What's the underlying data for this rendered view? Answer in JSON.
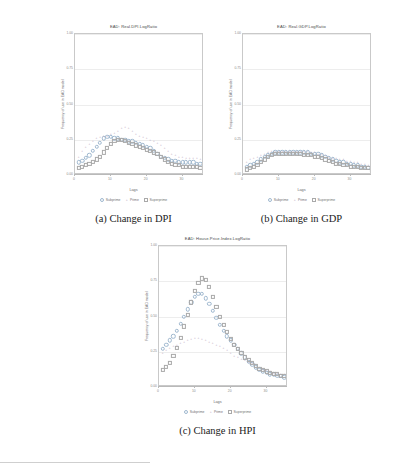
{
  "figure": {
    "panels": [
      {
        "id": "dpi",
        "title": "EAD: Real.DPI.LogRatio",
        "caption": "(a)  Change in DPI",
        "ylabel": "Frequency of use in EAD model",
        "xlabel": "Lags",
        "yticks": [
          "1.00",
          "0.75",
          "0.50",
          "0.25",
          "0.00"
        ],
        "xticks": [
          "0",
          "10",
          "20",
          "30"
        ],
        "legend": [
          {
            "key": "sub",
            "label": "Subprime"
          },
          {
            "key": "pri",
            "label": "Prime"
          },
          {
            "key": "sup",
            "label": "Superprime"
          }
        ]
      },
      {
        "id": "gdp",
        "title": "EAD: Real.GDP.LogRatio",
        "caption": "(b)  Change in GDP",
        "ylabel": "Frequency of use in EAD model",
        "xlabel": "Lags",
        "yticks": [
          "1.00",
          "0.75",
          "0.50",
          "0.25",
          "0.00"
        ],
        "xticks": [
          "0",
          "10",
          "20",
          "30"
        ],
        "legend": [
          {
            "key": "sub",
            "label": "Subprime"
          },
          {
            "key": "pri",
            "label": "Prime"
          },
          {
            "key": "sup",
            "label": "Superprime"
          }
        ]
      },
      {
        "id": "hpi",
        "title": "EAD: House.Price.Index.LogRatio",
        "caption": "(c)  Change in HPI",
        "ylabel": "Frequency of use in EAD model",
        "xlabel": "Lags",
        "yticks": [
          "1.00",
          "0.75",
          "0.50",
          "0.25",
          "0.00"
        ],
        "xticks": [
          "0",
          "10",
          "20",
          "30"
        ],
        "legend": [
          {
            "key": "sub",
            "label": "Subprime"
          },
          {
            "key": "pri",
            "label": "Prime"
          },
          {
            "key": "sup",
            "label": "Superprime"
          }
        ]
      }
    ]
  },
  "chart_data": [
    {
      "type": "scatter",
      "title": "EAD: Real.DPI.LogRatio",
      "xlabel": "Lags",
      "ylabel": "Frequency of use in EAD model",
      "xlim": [
        0,
        36
      ],
      "ylim": [
        0,
        1.0
      ],
      "yticks": [
        0.0,
        0.25,
        0.5,
        0.75,
        1.0
      ],
      "xticks": [
        0,
        10,
        20,
        30
      ],
      "grid": true,
      "legend_position": "bottom",
      "x": [
        1,
        2,
        3,
        4,
        5,
        6,
        7,
        8,
        9,
        10,
        11,
        12,
        13,
        14,
        15,
        16,
        17,
        18,
        19,
        20,
        21,
        22,
        23,
        24,
        25,
        26,
        27,
        28,
        29,
        30,
        31,
        32,
        33,
        34,
        35,
        36
      ],
      "series": [
        {
          "name": "Subprime",
          "marker": "open-circle",
          "color": "#9fb8cf",
          "values": [
            0.09,
            0.1,
            0.12,
            0.14,
            0.17,
            0.2,
            0.23,
            0.26,
            0.27,
            0.27,
            0.26,
            0.26,
            0.25,
            0.25,
            0.24,
            0.24,
            0.23,
            0.22,
            0.21,
            0.2,
            0.19,
            0.17,
            0.15,
            0.13,
            0.12,
            0.11,
            0.1,
            0.1,
            0.09,
            0.09,
            0.09,
            0.09,
            0.09,
            0.08,
            0.08,
            0.08
          ]
        },
        {
          "name": "Prime",
          "marker": "plus",
          "color": "#b9a7bd",
          "values": [
            0.13,
            0.17,
            0.2,
            0.22,
            0.24,
            0.26,
            0.27,
            0.28,
            0.28,
            0.29,
            0.3,
            0.31,
            0.33,
            0.34,
            0.33,
            0.31,
            0.29,
            0.28,
            0.27,
            0.26,
            0.25,
            0.24,
            0.23,
            0.21,
            0.19,
            0.17,
            0.15,
            0.14,
            0.13,
            0.13,
            0.12,
            0.12,
            0.12,
            0.12,
            0.11,
            0.11
          ]
        },
        {
          "name": "Superprime",
          "marker": "open-square",
          "color": "#a9a9a9",
          "values": [
            0.05,
            0.06,
            0.07,
            0.08,
            0.09,
            0.11,
            0.13,
            0.16,
            0.19,
            0.22,
            0.24,
            0.25,
            0.25,
            0.24,
            0.23,
            0.22,
            0.21,
            0.2,
            0.19,
            0.18,
            0.17,
            0.16,
            0.15,
            0.13,
            0.11,
            0.09,
            0.08,
            0.07,
            0.07,
            0.06,
            0.06,
            0.06,
            0.06,
            0.06,
            0.05,
            0.05
          ]
        }
      ]
    },
    {
      "type": "scatter",
      "title": "EAD: Real.GDP.LogRatio",
      "xlabel": "Lags",
      "ylabel": "Frequency of use in EAD model",
      "xlim": [
        0,
        36
      ],
      "ylim": [
        0,
        1.0
      ],
      "yticks": [
        0.0,
        0.25,
        0.5,
        0.75,
        1.0
      ],
      "xticks": [
        0,
        10,
        20,
        30
      ],
      "grid": true,
      "legend_position": "bottom",
      "x": [
        1,
        2,
        3,
        4,
        5,
        6,
        7,
        8,
        9,
        10,
        11,
        12,
        13,
        14,
        15,
        16,
        17,
        18,
        19,
        20,
        21,
        22,
        23,
        24,
        25,
        26,
        27,
        28,
        29,
        30,
        31,
        32,
        33,
        34,
        35,
        36
      ],
      "series": [
        {
          "name": "Subprime",
          "marker": "open-circle",
          "color": "#9fb8cf",
          "values": [
            0.06,
            0.07,
            0.08,
            0.09,
            0.11,
            0.13,
            0.14,
            0.15,
            0.16,
            0.16,
            0.16,
            0.16,
            0.16,
            0.16,
            0.16,
            0.16,
            0.16,
            0.16,
            0.15,
            0.15,
            0.15,
            0.14,
            0.13,
            0.12,
            0.11,
            0.1,
            0.09,
            0.09,
            0.08,
            0.08,
            0.07,
            0.07,
            0.06,
            0.06,
            0.05,
            0.05
          ]
        },
        {
          "name": "Prime",
          "marker": "plus",
          "color": "#b9a7bd",
          "values": [
            0.09,
            0.11,
            0.12,
            0.13,
            0.14,
            0.15,
            0.16,
            0.17,
            0.17,
            0.17,
            0.17,
            0.17,
            0.17,
            0.17,
            0.17,
            0.17,
            0.17,
            0.17,
            0.16,
            0.16,
            0.15,
            0.15,
            0.14,
            0.13,
            0.12,
            0.12,
            0.11,
            0.11,
            0.1,
            0.1,
            0.09,
            0.09,
            0.08,
            0.08,
            0.07,
            0.07
          ]
        },
        {
          "name": "Superprime",
          "marker": "open-square",
          "color": "#a9a9a9",
          "values": [
            0.04,
            0.05,
            0.06,
            0.07,
            0.09,
            0.11,
            0.13,
            0.14,
            0.15,
            0.15,
            0.15,
            0.15,
            0.15,
            0.15,
            0.15,
            0.15,
            0.14,
            0.14,
            0.14,
            0.13,
            0.13,
            0.12,
            0.11,
            0.1,
            0.09,
            0.08,
            0.08,
            0.07,
            0.07,
            0.06,
            0.06,
            0.06,
            0.05,
            0.05,
            0.05,
            0.04
          ]
        }
      ]
    },
    {
      "type": "scatter",
      "title": "EAD: House.Price.Index.LogRatio",
      "xlabel": "Lags",
      "ylabel": "Frequency of use in EAD model",
      "xlim": [
        0,
        36
      ],
      "ylim": [
        0,
        1.0
      ],
      "yticks": [
        0.0,
        0.25,
        0.5,
        0.75,
        1.0
      ],
      "xticks": [
        0,
        10,
        20,
        30
      ],
      "grid": true,
      "legend_position": "bottom",
      "x": [
        1,
        2,
        3,
        4,
        5,
        6,
        7,
        8,
        9,
        10,
        11,
        12,
        13,
        14,
        15,
        16,
        17,
        18,
        19,
        20,
        21,
        22,
        23,
        24,
        25,
        26,
        27,
        28,
        29,
        30,
        31,
        32,
        33,
        34,
        35,
        36
      ],
      "series": [
        {
          "name": "Subprime",
          "marker": "open-circle",
          "color": "#9fb8cf",
          "values": [
            0.27,
            0.3,
            0.33,
            0.36,
            0.4,
            0.45,
            0.5,
            0.55,
            0.6,
            0.64,
            0.66,
            0.66,
            0.63,
            0.59,
            0.54,
            0.49,
            0.44,
            0.4,
            0.36,
            0.33,
            0.3,
            0.27,
            0.24,
            0.21,
            0.18,
            0.16,
            0.14,
            0.12,
            0.11,
            0.1,
            0.09,
            0.09,
            0.08,
            0.08,
            0.07,
            0.07
          ]
        },
        {
          "name": "Prime",
          "marker": "plus",
          "color": "#b9a7bd",
          "values": [
            0.24,
            0.26,
            0.28,
            0.29,
            0.3,
            0.31,
            0.32,
            0.33,
            0.34,
            0.35,
            0.35,
            0.34,
            0.33,
            0.32,
            0.31,
            0.3,
            0.29,
            0.28,
            0.26,
            0.24,
            0.22,
            0.21,
            0.2,
            0.19,
            0.18,
            0.17,
            0.16,
            0.14,
            0.13,
            0.12,
            0.11,
            0.1,
            0.1,
            0.09,
            0.09,
            0.08
          ]
        },
        {
          "name": "Superprime",
          "marker": "open-square",
          "color": "#a9a9a9",
          "values": [
            0.12,
            0.14,
            0.17,
            0.22,
            0.28,
            0.35,
            0.43,
            0.51,
            0.6,
            0.68,
            0.74,
            0.77,
            0.76,
            0.71,
            0.64,
            0.57,
            0.5,
            0.44,
            0.39,
            0.34,
            0.3,
            0.27,
            0.24,
            0.21,
            0.19,
            0.17,
            0.15,
            0.13,
            0.12,
            0.11,
            0.1,
            0.09,
            0.09,
            0.08,
            0.08,
            0.07
          ]
        }
      ]
    }
  ]
}
